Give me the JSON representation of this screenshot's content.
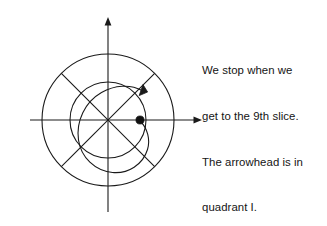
{
  "canvas": {
    "width": 327,
    "height": 226,
    "background": "#ffffff",
    "ink": "#1a1a1a"
  },
  "caption": {
    "name": "explanation-text",
    "lines": [
      "We stop when we",
      "get to the 9th slice.",
      "The arrowhead is in",
      "quadrant I."
    ],
    "full_text": "We stop when we get to the 9th slice. The arrowhead is in quadrant I.",
    "color": "#141414",
    "font_size_px": 11.4,
    "line_height_px": 15.2,
    "x": 202,
    "y": 33
  },
  "diagram": {
    "name": "polar-slice-diagram",
    "center": {
      "x": 108,
      "y": 120
    },
    "stroke_color": "#1a1a1a",
    "stroke_width": 1.1,
    "axes": {
      "x_axis": {
        "label": "x-axis",
        "x_start": 30,
        "x_end": 202,
        "y": 120,
        "arrowhead": "right"
      },
      "y_axis": {
        "label": "y-axis",
        "y_start": 17,
        "y_end": 212,
        "x": 108,
        "arrowhead": "up"
      }
    },
    "circles": [
      {
        "label": "inner-circle",
        "radius": 38
      },
      {
        "label": "outer-circle",
        "radius": 66
      }
    ],
    "diagonals": [
      {
        "label": "diagonal-ne-sw",
        "angle_deg": 45
      },
      {
        "label": "diagonal-nw-se",
        "angle_deg": 135
      }
    ],
    "slice_count": 8,
    "point": {
      "label": "start-point",
      "x": 140,
      "y": 120,
      "radius": 4.1,
      "fill": "#111111"
    },
    "spiral_arrow": {
      "label": "spiral-arrow",
      "direction": "counterclockwise",
      "start": {
        "x": 140,
        "y": 120
      },
      "arrowhead": {
        "x": 145,
        "y": 86
      },
      "quadrant": "I",
      "slices_traversed": 9
    }
  }
}
